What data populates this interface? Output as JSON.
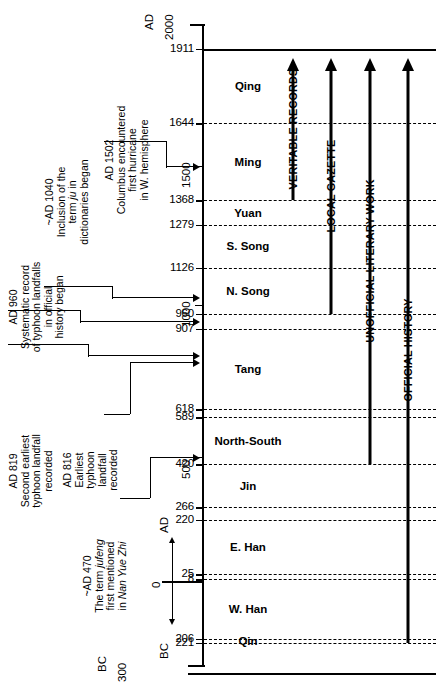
{
  "figure": {
    "type": "timeline",
    "orientation": "vertical",
    "axis": {
      "top_label": "AD",
      "top_value": "2000",
      "bottom_label": "BC",
      "bottom_value": "300",
      "era_zero_label": "0",
      "era_up_label": "AD",
      "era_down_label": "BC",
      "decade_labels": [
        "1500",
        "1000",
        "500"
      ],
      "range_top_year": 2000,
      "range_bottom_year": -300
    },
    "axis_ticks": [
      {
        "label": "1911",
        "year": 1911,
        "style": "solid-full"
      },
      {
        "label": "1644",
        "year": 1644,
        "style": "dashed"
      },
      {
        "label": "1368",
        "year": 1368,
        "style": "dashed"
      },
      {
        "label": "1279",
        "year": 1279,
        "style": "dashed"
      },
      {
        "label": "1126",
        "year": 1126,
        "style": "dashed"
      },
      {
        "label": "960",
        "year": 960,
        "style": "dashed"
      },
      {
        "label": "907",
        "year": 907,
        "style": "dashed"
      },
      {
        "label": "618",
        "year": 618,
        "style": "dashed"
      },
      {
        "label": "589",
        "year": 589,
        "style": "dashed"
      },
      {
        "label": "420",
        "year": 420,
        "style": "dashed"
      },
      {
        "label": "266",
        "year": 266,
        "style": "dashed"
      },
      {
        "label": "220",
        "year": 220,
        "style": "dashed"
      },
      {
        "label": "25",
        "year": 25,
        "style": "dashed"
      },
      {
        "label": "8",
        "year": 8,
        "style": "dashed"
      },
      {
        "label": "206",
        "year": -206,
        "style": "dashed"
      },
      {
        "label": "221",
        "year": -221,
        "style": "dashed"
      }
    ],
    "dynasties": [
      {
        "name": "Qing",
        "from": 1644,
        "to": 1911
      },
      {
        "name": "Ming",
        "from": 1368,
        "to": 1644
      },
      {
        "name": "Yuan",
        "from": 1279,
        "to": 1368
      },
      {
        "name": "S. Song",
        "from": 1126,
        "to": 1279
      },
      {
        "name": "N. Song",
        "from": 960,
        "to": 1126
      },
      {
        "name": "Tang",
        "from": 618,
        "to": 907
      },
      {
        "name": "North-South",
        "from": 420,
        "to": 589
      },
      {
        "name": "Jin",
        "from": 266,
        "to": 420
      },
      {
        "name": "E. Han",
        "from": 25,
        "to": 220
      },
      {
        "name": "W. Han",
        "from": -206,
        "to": 8
      },
      {
        "name": "Qin",
        "from": -221,
        "to": -206
      }
    ],
    "sources": [
      {
        "label": "VERITABLE RECORDS",
        "start_year": 1368,
        "end_year": 1911
      },
      {
        "label": "LOCAL GAZETTE",
        "start_year": 960,
        "end_year": 1911
      },
      {
        "label": "UNOFFICIAL LITERARY WORK",
        "start_year": 420,
        "end_year": 1911
      },
      {
        "label": "OFFICIAL HISTORY",
        "start_year": -221,
        "end_year": 1911
      }
    ],
    "annotations": [
      {
        "id": "ad-1502",
        "year": 1502,
        "date": "AD 1502",
        "lines": [
          "Columbus encountered",
          "first hurricane",
          "in W. hemisphere"
        ]
      },
      {
        "id": "ad-1040",
        "year": 1040,
        "date": "~AD 1040",
        "lines": [
          "Inclusion of the",
          "term ju in",
          "dictionaries began"
        ],
        "italic_terms": [
          "ju"
        ]
      },
      {
        "id": "ad-960",
        "year": 960,
        "date": "AD 960",
        "lines": [
          "Systematic record",
          "of typhoon landfalls",
          "in official",
          "history began"
        ]
      },
      {
        "id": "ad-819",
        "year": 819,
        "date": "AD 819",
        "lines": [
          "Second earliest",
          "typhoon landfall",
          "recorded"
        ]
      },
      {
        "id": "ad-816",
        "year": 816,
        "date": "AD 816",
        "lines": [
          "Earliest",
          "typhoon",
          "landfall",
          "recorded"
        ]
      },
      {
        "id": "ad-470",
        "year": 470,
        "date": "~AD 470",
        "lines": [
          "The term jufeng",
          "first mentioned",
          "in Nan Yue Zhi"
        ],
        "italic_terms": [
          "jufeng",
          "Nan Yue Zhi"
        ]
      }
    ],
    "colors": {
      "ink": "#000000",
      "background": "#ffffff"
    }
  }
}
